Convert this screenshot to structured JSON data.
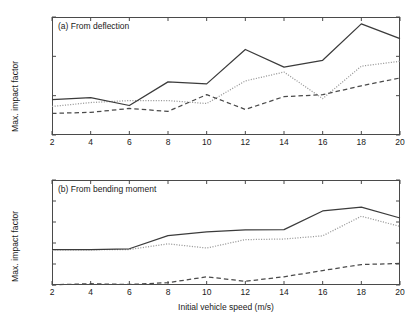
{
  "figure": {
    "xlabel": "Initial vehicle speed (m/s)",
    "ylabel_a": "Max. impact factor",
    "ylabel_b": "Max. impact factor",
    "colors": {
      "solid": "#3b3b3b",
      "dotted": "#9a9a9a",
      "dashed": "#4a4a4a",
      "axis": "#4a4a4a",
      "text": "#1a1a1a",
      "background": "#ffffff"
    }
  },
  "chart_data": [
    {
      "type": "line",
      "title": "(a) From deflection",
      "xlabel": "",
      "ylabel": "Max. impact factor",
      "x": [
        2,
        4,
        6,
        8,
        10,
        12,
        14,
        16,
        18,
        20
      ],
      "xlim": [
        2,
        20
      ],
      "ylim": [
        1,
        1.06
      ],
      "xticks": [
        2,
        4,
        6,
        8,
        10,
        12,
        14,
        16,
        18,
        20
      ],
      "yticks": [
        1,
        1.02,
        1.04,
        1.06
      ],
      "ytick_labels": [
        "1",
        "1.02",
        "1.04",
        "1.06"
      ],
      "xtick_labels": [
        "2",
        "4",
        "6",
        "8",
        "10",
        "12",
        "14",
        "16",
        "18",
        "20"
      ],
      "grid": false,
      "legend": "none",
      "series": [
        {
          "name": "solid",
          "style": "solid",
          "values": [
            1.018,
            1.019,
            1.015,
            1.027,
            1.026,
            1.0435,
            1.0345,
            1.038,
            1.0565,
            1.049
          ]
        },
        {
          "name": "dotted",
          "style": "dotted",
          "values": [
            1.0145,
            1.0165,
            1.0175,
            1.0175,
            1.016,
            1.0275,
            1.032,
            1.0185,
            1.035,
            1.0375
          ]
        },
        {
          "name": "dashed",
          "style": "dashed",
          "values": [
            1.011,
            1.0115,
            1.0135,
            1.012,
            1.0205,
            1.013,
            1.0195,
            1.0205,
            1.025,
            1.029
          ]
        }
      ]
    },
    {
      "type": "line",
      "title": "(b) From bending moment",
      "xlabel": "Initial vehicle speed (m/s)",
      "ylabel": "Max. impact factor",
      "x": [
        2,
        4,
        6,
        8,
        10,
        12,
        14,
        16,
        18,
        20
      ],
      "xlim": [
        2,
        20
      ],
      "ylim": [
        1,
        1.1
      ],
      "xticks": [
        2,
        4,
        6,
        8,
        10,
        12,
        14,
        16,
        18,
        20
      ],
      "yticks": [
        1,
        1.02,
        1.04,
        1.06,
        1.08,
        1.1
      ],
      "ytick_labels": [
        "1",
        "1.02",
        "1.04",
        "1.06",
        "1.08",
        "1.1"
      ],
      "xtick_labels": [
        "2",
        "4",
        "6",
        "8",
        "10",
        "12",
        "14",
        "16",
        "18",
        "20"
      ],
      "grid": false,
      "legend": "none",
      "series": [
        {
          "name": "solid",
          "style": "solid",
          "values": [
            1.0338,
            1.0338,
            1.0345,
            1.047,
            1.0505,
            1.0525,
            1.0527,
            1.0705,
            1.0742,
            1.0638
          ]
        },
        {
          "name": "dotted",
          "style": "dotted",
          "values": [
            1.0335,
            1.0335,
            1.0338,
            1.0392,
            1.0352,
            1.0432,
            1.0438,
            1.0468,
            1.0655,
            1.0558
          ]
        },
        {
          "name": "dashed",
          "style": "dashed",
          "values": [
            1.0002,
            1.0012,
            1.0005,
            1.0022,
            1.0078,
            1.0035,
            1.0078,
            1.0138,
            1.0195,
            1.0205
          ]
        }
      ]
    }
  ]
}
